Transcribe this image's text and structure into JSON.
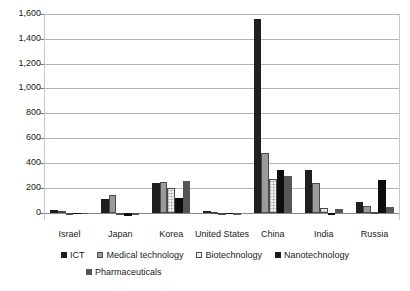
{
  "chart_data": {
    "type": "bar",
    "title": "",
    "subtitle": "",
    "xlabel": "",
    "ylabel": "",
    "ylim": [
      -60,
      1600
    ],
    "yticks": [
      0,
      200,
      400,
      600,
      800,
      1000,
      1200,
      1400,
      1600
    ],
    "ytick_labels": [
      "0",
      "200",
      "400",
      "600",
      "800",
      "1,000",
      "1,200",
      "1,400",
      "1,600"
    ],
    "grid": true,
    "legend_position": "bottom",
    "categories": [
      "Israel",
      "Japan",
      "Korea",
      "United States",
      "China",
      "India",
      "Russia"
    ],
    "series": [
      {
        "name": "ICT",
        "color": "#1f1f1f",
        "swatch": "solid-black",
        "values": [
          18,
          110,
          235,
          12,
          1560,
          345,
          85
        ]
      },
      {
        "name": "Medical technology",
        "color": "#9b9b9b",
        "swatch": "light-gray",
        "values": [
          16,
          145,
          245,
          6,
          480,
          235,
          55
        ]
      },
      {
        "name": "Biotechnology",
        "color": "#f2f2f2",
        "swatch": "white-dotted",
        "values": [
          -10,
          -8,
          195,
          -12,
          270,
          40,
          8
        ]
      },
      {
        "name": "Nanotechnology",
        "color": "#0d0d0d",
        "swatch": "solid-black",
        "values": [
          -12,
          -30,
          115,
          -14,
          340,
          -20,
          260
        ]
      },
      {
        "name": "Pharmaceuticals",
        "color": "#555555",
        "swatch": "dark-gray",
        "values": [
          -14,
          -18,
          255,
          -16,
          295,
          30,
          45
        ]
      }
    ]
  },
  "axis": {
    "ytick_labels": [
      "1,600",
      "1,400",
      "1,200",
      "1,000",
      "800",
      "600",
      "400",
      "200",
      "0"
    ],
    "category_labels": [
      "Israel",
      "Japan",
      "Korea",
      "United States",
      "China",
      "India",
      "Russia"
    ]
  },
  "legend": {
    "row1": [
      {
        "label": "ICT",
        "swatch": "solid-black"
      },
      {
        "label": "Medical technology",
        "swatch": "light-gray"
      },
      {
        "label": "Biotechnology",
        "swatch": "white-dotted"
      },
      {
        "label": "Nanotechnology",
        "swatch": "solid-black"
      }
    ],
    "row2": [
      {
        "label": "Pharmaceuticals",
        "swatch": "dark-gray"
      }
    ]
  }
}
